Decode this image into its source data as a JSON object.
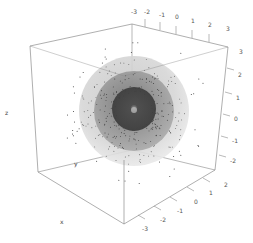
{
  "chart_data": {
    "type": "scatter3d",
    "title": "",
    "axes": {
      "x": {
        "label": "x",
        "ticks": [
          -3,
          -2,
          -1,
          0,
          1,
          2
        ],
        "range": [
          -3,
          3
        ]
      },
      "y": {
        "label": "y",
        "ticks": [
          -3,
          -2,
          -1,
          0,
          1,
          2,
          3
        ],
        "range": [
          -3,
          3
        ]
      },
      "z": {
        "label": "z",
        "ticks": [
          -2,
          -1,
          0,
          1,
          2,
          3
        ],
        "range": [
          -3,
          3
        ]
      }
    },
    "surfaces": [
      {
        "name": "outer-sphere",
        "radius": 3,
        "color": "#d9d9d9",
        "opacity": 0.5
      },
      {
        "name": "middle-sphere",
        "radius": 2.2,
        "color": "#8a8a8a",
        "opacity": 0.5
      },
      {
        "name": "inner-sphere",
        "radius": 1.2,
        "color": "#3c3c3c",
        "opacity": 0.7
      }
    ],
    "points_description": "Random points scattered around origin, concentrated within radius ~3",
    "grid": false,
    "box": true,
    "legend": null
  },
  "labels": {
    "top_ticks": [
      "-3",
      "-2",
      "-1",
      "0",
      "1",
      "2",
      "3"
    ],
    "right_ticks": [
      "3",
      "2",
      "1",
      "0",
      "-1",
      "-2"
    ],
    "bottom_ticks": [
      "2",
      "1",
      "0",
      "-1",
      "-2",
      "-3"
    ],
    "x_title": "x",
    "y_title": "y",
    "z_title": "z"
  },
  "colors": {
    "box": "#8c8c8c",
    "points": "#222222",
    "outer": "#dcdcdc",
    "middle": "#9a9a9a",
    "inner": "#464646"
  }
}
